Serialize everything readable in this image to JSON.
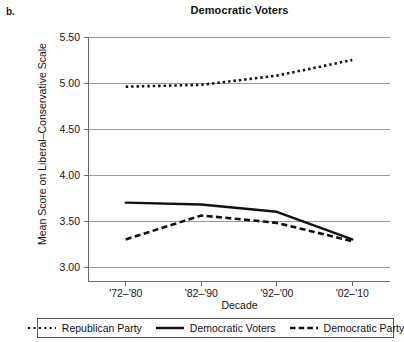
{
  "panel": {
    "label": "b."
  },
  "axis_titles": {
    "y": "Mean Score on Liberal–Conservative Scale",
    "x": "Decade"
  },
  "chart_data": {
    "type": "line",
    "title": "Democratic Voters",
    "xlabel": "Decade",
    "ylabel": "Mean Score on Liberal–Conservative Scale",
    "categories": [
      "'72–'80",
      "'82–'90",
      "'92–'00",
      "'02–'10"
    ],
    "ylim": [
      3.0,
      5.5
    ],
    "yticks": [
      "3.00",
      "3.50",
      "4.00",
      "4.50",
      "5.00",
      "5.50"
    ],
    "ytick_values": [
      3.0,
      3.5,
      4.0,
      4.5,
      5.0,
      5.5
    ],
    "grid": true,
    "legend_position": "bottom",
    "series": [
      {
        "name": "Republican Party",
        "style": "dotted",
        "color": "#111111",
        "values": [
          4.96,
          4.98,
          5.08,
          5.25
        ]
      },
      {
        "name": "Democratic Voters",
        "style": "solid",
        "color": "#111111",
        "values": [
          3.7,
          3.68,
          3.6,
          3.3
        ]
      },
      {
        "name": "Democratic Party",
        "style": "dashed",
        "color": "#111111",
        "values": [
          3.3,
          3.56,
          3.48,
          3.28
        ]
      }
    ]
  },
  "legend": {
    "items": [
      {
        "label": "Republican Party",
        "swatch": "dotted-line-swatch"
      },
      {
        "label": "Democratic Voters",
        "swatch": "solid-line-swatch"
      },
      {
        "label": "Democratic Party",
        "swatch": "dashed-line-swatch"
      }
    ]
  }
}
